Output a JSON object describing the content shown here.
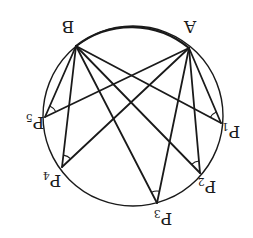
{
  "diagram": {
    "orientation": "rotated 180 degrees",
    "stroke_color": "#1a1a1a",
    "background": "#ffffff",
    "circle": {
      "cx": 133,
      "cy": 116,
      "r": 90
    },
    "points": [
      {
        "id": "A",
        "label": "A",
        "sub": "",
        "x": 189,
        "y": 48
      },
      {
        "id": "B",
        "label": "B",
        "sub": "",
        "x": 76,
        "y": 46
      },
      {
        "id": "P1",
        "label": "P",
        "sub": "1",
        "x": 221,
        "y": 123
      },
      {
        "id": "P2",
        "label": "P",
        "sub": "2",
        "x": 200,
        "y": 173
      },
      {
        "id": "P3",
        "label": "P",
        "sub": "3",
        "x": 157,
        "y": 203
      },
      {
        "id": "P4",
        "label": "P",
        "sub": "4",
        "x": 62,
        "y": 167
      },
      {
        "id": "P5",
        "label": "P",
        "sub": "5",
        "x": 45,
        "y": 117
      }
    ],
    "labels": {
      "A": {
        "text": "A",
        "x": 190,
        "y": 26
      },
      "B": {
        "text": "B",
        "x": 68,
        "y": 26
      },
      "P1": {
        "text": "P",
        "sub": "1",
        "x": 231,
        "y": 131
      },
      "P2": {
        "text": "P",
        "sub": "2",
        "x": 207,
        "y": 186
      },
      "P3": {
        "text": "P",
        "sub": "3",
        "x": 163,
        "y": 218
      },
      "P4": {
        "text": "P",
        "sub": "4",
        "x": 52,
        "y": 180
      },
      "P5": {
        "text": "P",
        "sub": "5",
        "x": 35,
        "y": 122
      }
    },
    "angle_marks": [
      "P1",
      "P2",
      "P3",
      "P4",
      "P5"
    ],
    "note": "All angles AP_kB are equal (inscribed angles on the same arc)"
  }
}
